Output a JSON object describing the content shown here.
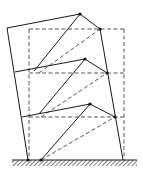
{
  "diagram": {
    "title": "",
    "colors": {
      "line": "#1a1a1a",
      "dashed_line": "#444444",
      "node": "#111111",
      "background": "#ffffff"
    },
    "ground": {
      "x1": 12,
      "x2": 137,
      "y": 160,
      "thickness": 6,
      "style": "hatched"
    },
    "undeformed_frame": {
      "style": "dashed",
      "left_x": 29,
      "right_x": 124,
      "floor_levels_y": [
        29,
        73,
        117,
        160
      ],
      "braces": [
        {
          "from": [
            39,
            73
          ],
          "to": [
            100,
            29
          ]
        },
        {
          "from": [
            41,
            117
          ],
          "to": [
            107,
            73
          ]
        },
        {
          "from": [
            41,
            160
          ],
          "to": [
            115,
            117
          ]
        }
      ]
    },
    "deformed_frame": {
      "style": "solid",
      "left_column": [
        [
          7,
          28
        ],
        [
          28,
          160
        ]
      ],
      "right_column": [
        [
          100,
          29
        ],
        [
          123,
          160
        ]
      ],
      "floors": [
        {
          "name": "roof",
          "points": [
            [
              7,
              28
            ],
            [
              80,
              14
            ],
            [
              100,
              29
            ]
          ]
        },
        {
          "name": "floor-2",
          "points": [
            [
              15,
              72
            ],
            [
              85,
              59
            ],
            [
              107,
              73
            ]
          ]
        },
        {
          "name": "floor-1",
          "points": [
            [
              22,
              117
            ],
            [
              90,
              104
            ],
            [
              115,
              117
            ]
          ]
        }
      ],
      "braces": [
        {
          "from": [
            34,
            71
          ],
          "to": [
            80,
            14
          ]
        },
        {
          "from": [
            39,
            114
          ],
          "to": [
            85,
            59
          ]
        },
        {
          "from": [
            41,
            160
          ],
          "to": [
            90,
            104
          ]
        }
      ],
      "nodes": [
        [
          80,
          14
        ],
        [
          100,
          29
        ],
        [
          85,
          59
        ],
        [
          107,
          73
        ],
        [
          90,
          104
        ],
        [
          115,
          117
        ],
        [
          28,
          160
        ],
        [
          41,
          160
        ]
      ]
    }
  }
}
